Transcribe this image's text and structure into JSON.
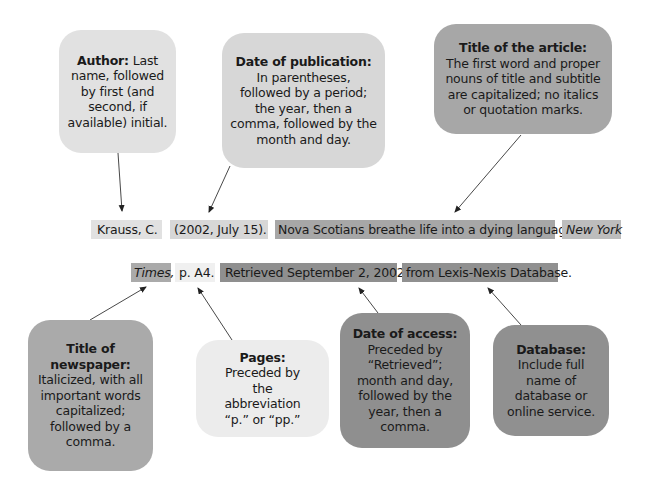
{
  "colors": {
    "author": "#e1e1e1",
    "date_publication": "#d7d7d7",
    "title_article": "#a7a7a7",
    "newspaper": "#aaaaaa",
    "pages": "#ececec",
    "date_access": "#8f8f8f",
    "database": "#909090"
  },
  "callouts": {
    "author": {
      "head": "Author:",
      "text": " Last name, followed by first (and second, if available) initial."
    },
    "date_publication": {
      "head": "Date of publication:",
      "text": "In parentheses, followed by a period; the year, then a comma, followed by the month and day."
    },
    "title_article": {
      "head": "Title of the article:",
      "text": "The first word and proper nouns of title and subtitle are capitalized; no italics or quotation marks."
    },
    "newspaper": {
      "head": "Title of newspaper:",
      "text": "Italicized, with all important words capitalized; followed by a comma."
    },
    "pages": {
      "head": "Pages:",
      "text": "Preceded by the abbreviation “p.” or “pp.”"
    },
    "date_access": {
      "head": "Date of access:",
      "text": "Preceded by “Retrieved”; month and day, followed by the year, then a comma."
    },
    "database": {
      "head": "Database:",
      "text": "Include full name of database or online service."
    }
  },
  "citation": {
    "line1": {
      "author": "Krauss, C.",
      "date": "(2002, July 15).",
      "title": "Nova Scotians breathe life into a dying language.",
      "newspaper_part1": "New York"
    },
    "line2": {
      "newspaper_part2": "Times,",
      "pages": "p. A4.",
      "retrieved": "Retrieved September 2, 2002,",
      "database": "from Lexis-Nexis Database."
    }
  }
}
